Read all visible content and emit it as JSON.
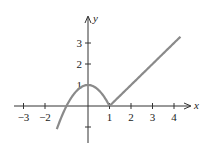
{
  "chart_data": {
    "type": "line",
    "title": "",
    "xlabel": "x",
    "ylabel": "y",
    "x_ticks": [
      -3,
      -2,
      1,
      2,
      3,
      4
    ],
    "y_ticks": [
      1,
      2,
      3
    ],
    "x_tick_labels": [
      "−3",
      "−2",
      "1",
      "2",
      "3",
      "4"
    ],
    "y_tick_labels": [
      "1",
      "2",
      "3"
    ],
    "xlim": [
      -3.5,
      4.8
    ],
    "ylim": [
      -1.6,
      3.8
    ],
    "grid": false,
    "legend": null,
    "series": [
      {
        "name": "piecewise f(x)",
        "description": "y = 1 - x^2 for x <= 1; y = x - 1 for x >= 1",
        "color": "#8a8a8a",
        "pieces": [
          {
            "expr": "1 - x^2",
            "x_range": [
              -1.45,
              1
            ]
          },
          {
            "expr": "x - 1",
            "x_range": [
              1,
              4.3
            ]
          }
        ],
        "key_points": [
          {
            "x": -1,
            "y": 0
          },
          {
            "x": 0,
            "y": 1
          },
          {
            "x": 1,
            "y": 0
          },
          {
            "x": 4.3,
            "y": 3.3
          }
        ]
      }
    ]
  },
  "axes": {
    "x_name": "x",
    "y_name": "y",
    "x_tick_labels": [
      "−3",
      "−2",
      "1",
      "2",
      "3",
      "4"
    ],
    "y_tick_labels": [
      "1",
      "2",
      "3"
    ]
  }
}
